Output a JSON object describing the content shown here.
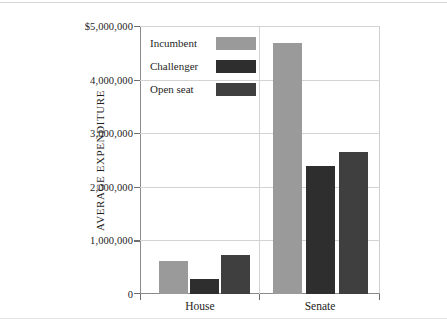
{
  "chart_data": {
    "type": "bar",
    "title": "",
    "subtitle": "",
    "xlabel": "",
    "ylabel": "AVERAGE EXPENDITURE",
    "categories": [
      "House",
      "Senate"
    ],
    "series": [
      {
        "name": "Incumbent",
        "values": [
          616000,
          4690000
        ],
        "color": "#9a9a9a"
      },
      {
        "name": "Challenger",
        "values": [
          280000,
          2390000
        ],
        "color": "#2e2e2e"
      },
      {
        "name": "Open seat",
        "values": [
          730000,
          2650000
        ],
        "color": "#3f3f3f"
      }
    ],
    "ylim": [
      0,
      5000000
    ],
    "ytick_values": [
      0,
      1000000,
      2000000,
      3000000,
      4000000,
      5000000
    ],
    "ytick_labels": [
      "0",
      "1,000,000",
      "2,000,000",
      "3,000,000",
      "4,000,000",
      "$5,000,000"
    ],
    "grid": true,
    "legend_position": "upper-left-inside",
    "annotations": []
  },
  "legend": {
    "entries": [
      {
        "label": "Incumbent",
        "color": "#9a9a9a"
      },
      {
        "label": "Challenger",
        "color": "#2e2e2e"
      },
      {
        "label": "Open seat",
        "color": "#3f3f3f"
      }
    ]
  },
  "axis": {
    "y_title": "AVERAGE EXPENDITURE",
    "y_ticks": [
      "$5,000,000",
      "4,000,000",
      "3,000,000",
      "2,000,000",
      "1,000,000",
      "0"
    ],
    "x_ticks": [
      "House",
      "Senate"
    ]
  }
}
